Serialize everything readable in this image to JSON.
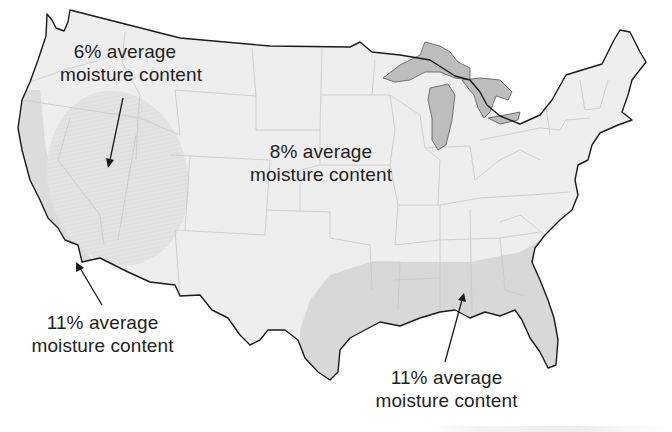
{
  "map": {
    "title": "Average wood moisture content by region, contiguous United States",
    "colors": {
      "land": "#eeeeee",
      "dry_zone": "#e6e6e6",
      "humid_zone": "#d9d9d9",
      "lakes": "#bdbdbd",
      "state_lines": "#c4c4c4",
      "coast_line": "#1a1a1a",
      "text": "#1e1e1e"
    },
    "zones": [
      {
        "id": "dry-southwest",
        "value": "6%",
        "line1": "6% average",
        "line2": "moisture content"
      },
      {
        "id": "interior",
        "value": "8%",
        "line1": "8% average",
        "line2": "moisture content"
      },
      {
        "id": "pacific-coast",
        "value": "11%",
        "line1": "11% average",
        "line2": "moisture content"
      },
      {
        "id": "gulf-southeast",
        "value": "11%",
        "line1": "11% average",
        "line2": "moisture content"
      }
    ]
  }
}
